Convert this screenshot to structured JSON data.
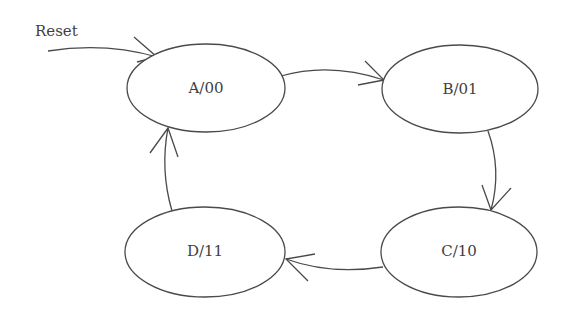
{
  "diagram": {
    "type": "state-machine",
    "colors": {
      "stroke": "#4a4a4a",
      "text": "#3f3f3f",
      "background": "#ffffff"
    },
    "reset_label": "Reset",
    "states": [
      {
        "id": "A",
        "label": "A/00",
        "name": "A",
        "output": "00"
      },
      {
        "id": "B",
        "label": "B/01",
        "name": "B",
        "output": "01"
      },
      {
        "id": "C",
        "label": "C/10",
        "name": "C",
        "output": "10"
      },
      {
        "id": "D",
        "label": "D/11",
        "name": "D",
        "output": "11"
      }
    ],
    "transitions": [
      {
        "from": "Reset",
        "to": "A"
      },
      {
        "from": "A",
        "to": "B"
      },
      {
        "from": "B",
        "to": "C"
      },
      {
        "from": "C",
        "to": "D"
      },
      {
        "from": "D",
        "to": "A"
      }
    ]
  }
}
